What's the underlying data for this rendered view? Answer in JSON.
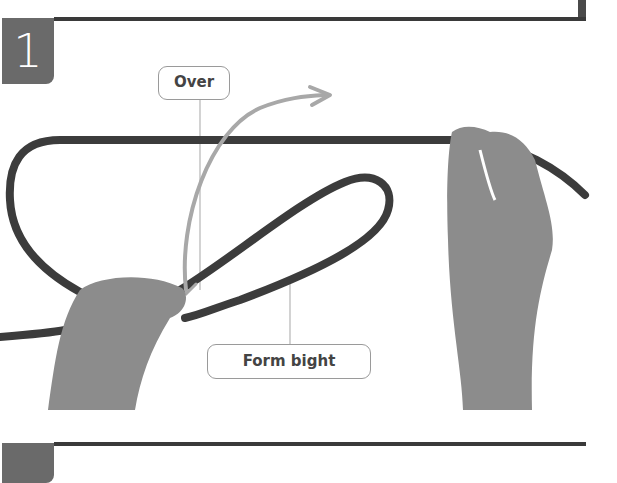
{
  "page": {
    "step_current": {
      "number": "1",
      "labels": {
        "over": "Over",
        "form_bight": "Form bight"
      }
    },
    "step_next": {
      "number": "2"
    }
  },
  "colors": {
    "rule": "#3a3a3a",
    "badge": "#6a6a6a",
    "rope": "#3c3c3c",
    "arrow": "#a8a8a8",
    "callout_border": "#9a9a9a",
    "hand": "#8c8c8c"
  }
}
